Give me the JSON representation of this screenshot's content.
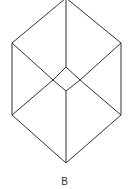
{
  "diagram": {
    "label": "B",
    "stroke_color": "#333333",
    "outer_hexagon": [
      [
        66,
        0
      ],
      [
        121,
        43
      ],
      [
        121,
        115
      ],
      [
        66,
        163
      ],
      [
        12,
        115
      ],
      [
        12,
        43
      ]
    ],
    "inner_diamond": [
      [
        66,
        67
      ],
      [
        80,
        80
      ],
      [
        66,
        91
      ],
      [
        53,
        80
      ]
    ],
    "connectors": [
      [
        [
          66,
          0
        ],
        [
          66,
          67
        ]
      ],
      [
        [
          66,
          91
        ],
        [
          66,
          163
        ]
      ],
      [
        [
          12,
          43
        ],
        [
          53,
          80
        ]
      ],
      [
        [
          12,
          115
        ],
        [
          53,
          80
        ]
      ],
      [
        [
          121,
          43
        ],
        [
          80,
          80
        ]
      ],
      [
        [
          121,
          115
        ],
        [
          80,
          80
        ]
      ]
    ]
  }
}
